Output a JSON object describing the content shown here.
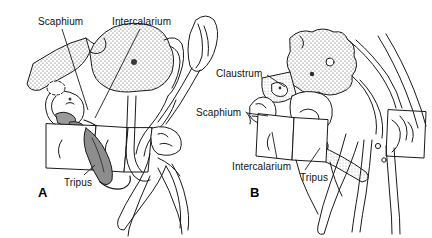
{
  "figure": {
    "background_color": "#ffffff",
    "ink_color": "#1a1a1a",
    "stipple_color": "#555555",
    "shade_color": "#b8b8b8",
    "width": 432,
    "height": 238
  },
  "panels": [
    {
      "id": "A",
      "id_label": "A",
      "labels": [
        {
          "name": "scaphium",
          "text": "Scaphium",
          "x": 38,
          "y": 16
        },
        {
          "name": "intercalarium",
          "text": "Intercalarium",
          "x": 112,
          "y": 16
        },
        {
          "name": "tripus",
          "text": "Tripus",
          "x": 64,
          "y": 177
        }
      ],
      "id_position": {
        "x": 38,
        "y": 186
      }
    },
    {
      "id": "B",
      "id_label": "B",
      "labels": [
        {
          "name": "claustrum",
          "text": "Claustrum",
          "x": 216,
          "y": 68
        },
        {
          "name": "scaphium",
          "text": "Scaphium",
          "x": 196,
          "y": 107
        },
        {
          "name": "intercalarium",
          "text": "Intercalarium",
          "x": 232,
          "y": 161
        },
        {
          "name": "tripus",
          "text": "Tripus",
          "x": 300,
          "y": 172
        }
      ],
      "id_position": {
        "x": 250,
        "y": 186
      }
    }
  ],
  "leader_lines": [
    {
      "name": "leader-scaphium-a",
      "x1": 62,
      "y1": 29,
      "x2": 88,
      "y2": 110
    },
    {
      "name": "leader-intercalarium-a",
      "x1": 140,
      "y1": 29,
      "x2": 95,
      "y2": 118
    },
    {
      "name": "leader-tripus-a",
      "x1": 84,
      "y1": 175,
      "x2": 95,
      "y2": 165
    },
    {
      "name": "leader-claustrum-b",
      "x1": 267,
      "y1": 75,
      "x2": 285,
      "y2": 87
    },
    {
      "name": "leader-scaphium-b",
      "x1": 247,
      "y1": 113,
      "x2": 268,
      "y2": 116
    },
    {
      "name": "leader-intercalarium-b",
      "x1": 277,
      "y1": 159,
      "x2": 272,
      "y2": 132
    },
    {
      "name": "leader-tripus-b",
      "x1": 305,
      "y1": 170,
      "x2": 320,
      "y2": 148
    }
  ]
}
